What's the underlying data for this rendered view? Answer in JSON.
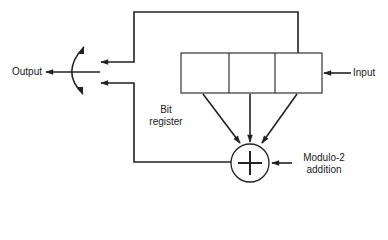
{
  "diagram": {
    "type": "shift-register feedback encoder",
    "labels": {
      "output": "Output",
      "input": "Input",
      "register_line1": "Bit",
      "register_line2": "register",
      "adder_line1": "Modulo-2",
      "adder_line2": "addition"
    },
    "register": {
      "cells": 3
    },
    "adder_symbol": "plus-in-circle",
    "colors": {
      "line": "#222222",
      "background": "#ffffff"
    }
  }
}
